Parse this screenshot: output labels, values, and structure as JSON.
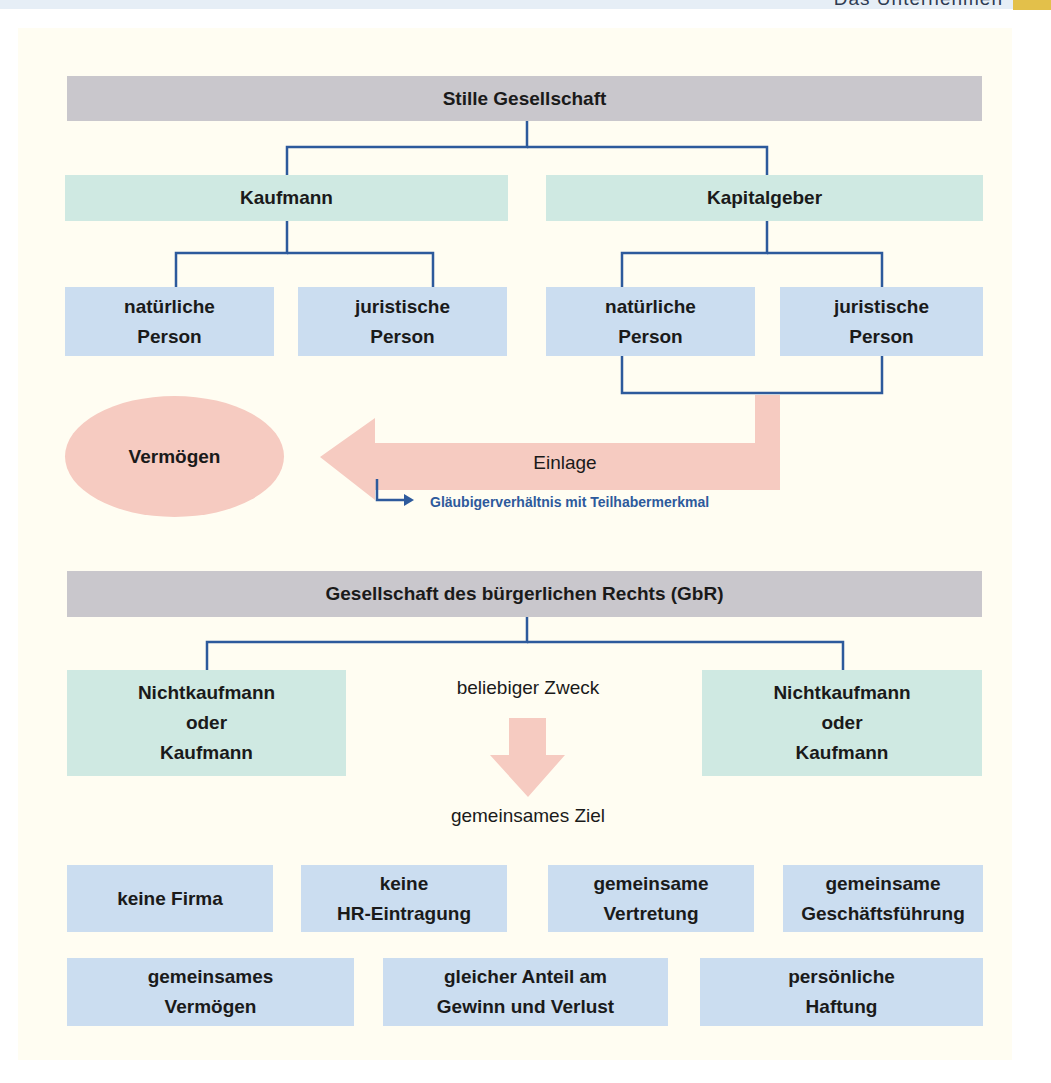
{
  "header": {
    "section_title": "Das Unternehmen"
  },
  "colors": {
    "title_bar": "#c9c7cc",
    "teal_box": "#cfe9e2",
    "blue_box": "#cbddf0",
    "connector": "#2d5a9c",
    "arrow": "#f6cbc1",
    "panel": "#fffdf2",
    "corner_tab": "#e3c04a"
  },
  "stille": {
    "title": "Stille Gesellschaft",
    "left": {
      "label": "Kaufmann",
      "children": [
        {
          "line1": "natürliche",
          "line2": "Person"
        },
        {
          "line1": "juristische",
          "line2": "Person"
        }
      ]
    },
    "right": {
      "label": "Kapitalgeber",
      "children": [
        {
          "line1": "natürliche",
          "line2": "Person"
        },
        {
          "line1": "juristische",
          "line2": "Person"
        }
      ]
    },
    "target": "Vermögen",
    "arrow_label": "Einlage",
    "note": "Gläubigerverhältnis mit Teilhabermerkmal"
  },
  "gbr": {
    "title": "Gesellschaft des bürgerlichen Rechts (GbR)",
    "left": {
      "line1": "Nichtkaufmann",
      "line2": "oder",
      "line3": "Kaufmann"
    },
    "right": {
      "line1": "Nichtkaufmann",
      "line2": "oder",
      "line3": "Kaufmann"
    },
    "purpose": "beliebiger Zweck",
    "goal": "gemeinsames Ziel",
    "features_row1": [
      {
        "line1": "keine Firma",
        "line2": ""
      },
      {
        "line1": "keine",
        "line2": "HR-Eintragung"
      },
      {
        "line1": "gemeinsame",
        "line2": "Vertretung"
      },
      {
        "line1": "gemeinsame",
        "line2": "Geschäftsführung"
      }
    ],
    "features_row2": [
      {
        "line1": "gemeinsames",
        "line2": "Vermögen"
      },
      {
        "line1": "gleicher Anteil am",
        "line2": "Gewinn und Verlust"
      },
      {
        "line1": "persönliche",
        "line2": "Haftung"
      }
    ]
  }
}
